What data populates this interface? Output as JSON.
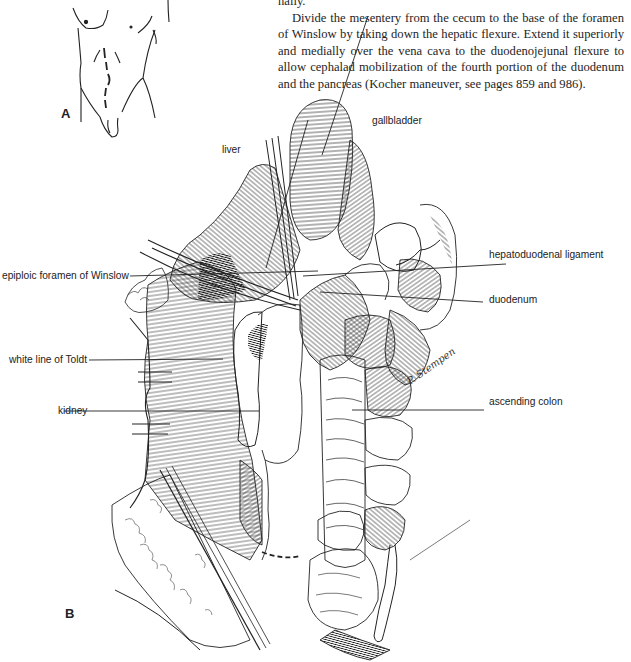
{
  "page": {
    "text": {
      "fragment": "nally.",
      "paragraph": "Divide the mesentery from the cecum to the base of the foramen of Winslow by taking down the hepatic flexure. Extend it superiorly and medially over the vena cava to the duodenojejunal flexure to allow cephalad mobilization of the fourth portion of the duodenum and the pancreas (Kocher maneuver, see pages 859 and 986)."
    },
    "figure_a": {
      "letter": "A",
      "description": "Torso outline with dashed incision line"
    },
    "figure_b": {
      "letter": "B",
      "signature": "P. Stempen",
      "labels": {
        "gallbladder": "gallbladder",
        "liver": "liver",
        "hepatoduodenal_ligament": "hepatoduodenal ligament",
        "epiploic_foramen": "epiploic foramen of Winslow",
        "duodenum": "duodenum",
        "white_line_of_toldt": "white line of Toldt",
        "kidney": "kidney",
        "ascending_colon": "ascending colon"
      }
    },
    "colors": {
      "ink": "#1a1a1a",
      "background": "#ffffff"
    }
  }
}
